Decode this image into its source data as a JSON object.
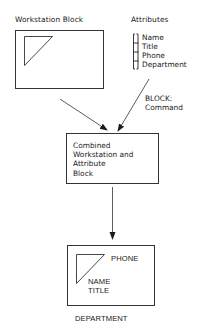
{
  "diagram": {
    "workstation_block": {
      "label": "Workstation Block"
    },
    "attributes": {
      "label": "Attributes",
      "items": [
        "Name",
        "Title",
        "Phone",
        "Department"
      ]
    },
    "block_command": {
      "lines": [
        "BLOCK:",
        "Command"
      ]
    },
    "combined_block": {
      "lines": [
        "Combined",
        "Workstation and",
        "Attribute",
        "Block"
      ]
    },
    "result_block": {
      "phone": "PHONE",
      "name": "NAME",
      "title": "TITLE",
      "department": "DEPARTMENT"
    },
    "colors": {
      "line": "#333333",
      "background": "#ffffff"
    }
  }
}
